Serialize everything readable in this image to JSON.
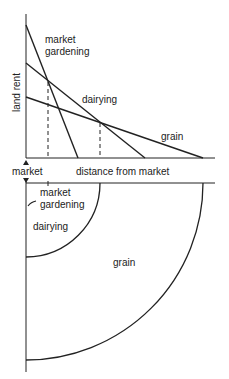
{
  "diagram": {
    "title": "",
    "top_graph": {
      "y_axis_label": "land rent",
      "x_axis_label": "distance from market",
      "origin_label": "market",
      "series": [
        {
          "name": "market gardening",
          "label_line1": "market",
          "label_line2": "gardening",
          "start": [
            26,
            25
          ],
          "end": [
            78,
            158
          ]
        },
        {
          "name": "dairying",
          "label": "dairying",
          "start": [
            26,
            63
          ],
          "end": [
            145,
            158
          ]
        },
        {
          "name": "grain",
          "label": "grain",
          "start": [
            26,
            97
          ],
          "end": [
            203,
            158
          ]
        }
      ],
      "intersections": [
        {
          "between": [
            "market gardening",
            "dairying"
          ],
          "x": 48
        },
        {
          "between": [
            "dairying",
            "grain"
          ],
          "x": 100
        }
      ]
    },
    "bottom_zones": {
      "zones": [
        {
          "name": "market gardening",
          "label_line1": "market",
          "label_line2": "gardening",
          "radius": 22
        },
        {
          "name": "dairying",
          "label": "dairying",
          "radius": 74
        },
        {
          "name": "grain",
          "label": "grain",
          "radius": 177
        }
      ]
    },
    "colors": {
      "line": "#222222",
      "background": "#ffffff"
    }
  }
}
